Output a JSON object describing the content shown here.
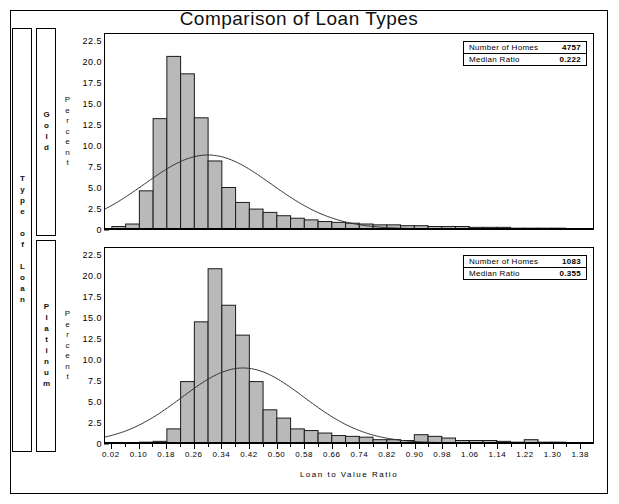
{
  "title": "Comparison of Loan Types",
  "axis": {
    "y_label": "Percent",
    "x_label": "Loan to Value Ratio",
    "y_ticks": [
      "22.5",
      "20.0",
      "17.5",
      "15.0",
      "12.5",
      "10.0",
      "7.5",
      "5.0",
      "2.5",
      "0"
    ],
    "x_ticks": [
      "0.02",
      "0.10",
      "0.18",
      "0.26",
      "0.34",
      "0.42",
      "0.50",
      "0.58",
      "0.66",
      "0.74",
      "0.82",
      "0.90",
      "0.98",
      "1.06",
      "1.14",
      "1.22",
      "1.30",
      "1.38"
    ]
  },
  "classification": {
    "outer_label": "Type of Loan",
    "panel_labels": [
      "Gold",
      "Platinum"
    ]
  },
  "legends": {
    "gold": {
      "number_of_homes_label": "Number of Homes",
      "number_of_homes_value": "4757",
      "median_ratio_label": "Median Ratio",
      "median_ratio_value": "0.222"
    },
    "platinum": {
      "number_of_homes_label": "Number of Homes",
      "number_of_homes_value": "1083",
      "median_ratio_label": "Median Ratio",
      "median_ratio_value": "0.355"
    }
  },
  "colors": {
    "bar_fill": "#b9b9b9",
    "bar_stroke": "#1a1a1a",
    "curve": "#303030",
    "frame": "#000000",
    "background": "#ffffff"
  },
  "chart_data": {
    "type": "bar",
    "title": "Comparison of Loan Types",
    "xlabel": "Loan to Value Ratio",
    "ylabel": "Percent",
    "xlim": [
      0.0,
      1.42
    ],
    "ylim": [
      0,
      23.5
    ],
    "bin_width": 0.04,
    "grid": false,
    "legend_position": "top-right inset box",
    "overlay": "normal density curve",
    "panels": [
      {
        "name": "Gold",
        "number_of_homes": 4757,
        "median_ratio": 0.222,
        "bin_centers": [
          0.04,
          0.08,
          0.12,
          0.16,
          0.2,
          0.24,
          0.28,
          0.32,
          0.36,
          0.4,
          0.44,
          0.48,
          0.52,
          0.56,
          0.6,
          0.64,
          0.68,
          0.72,
          0.76,
          0.8,
          0.84,
          0.88,
          0.92,
          0.96,
          1.0,
          1.04,
          1.08,
          1.12,
          1.16,
          1.2,
          1.24,
          1.28,
          1.32,
          1.36,
          1.4
        ],
        "values": [
          0.3,
          0.6,
          4.6,
          13.3,
          20.8,
          18.7,
          13.4,
          8.2,
          5.0,
          3.2,
          2.4,
          2.0,
          1.6,
          1.3,
          1.1,
          0.9,
          0.8,
          0.7,
          0.6,
          0.5,
          0.5,
          0.4,
          0.4,
          0.3,
          0.3,
          0.3,
          0.2,
          0.2,
          0.2,
          0.1,
          0.1,
          0.1,
          0.1,
          0.05,
          0.05
        ]
      },
      {
        "name": "Platinum",
        "number_of_homes": 1083,
        "median_ratio": 0.355,
        "bin_centers": [
          0.04,
          0.08,
          0.12,
          0.16,
          0.2,
          0.24,
          0.28,
          0.32,
          0.36,
          0.4,
          0.44,
          0.48,
          0.52,
          0.56,
          0.6,
          0.64,
          0.68,
          0.72,
          0.76,
          0.8,
          0.84,
          0.88,
          0.92,
          0.96,
          1.0,
          1.04,
          1.08,
          1.12,
          1.16,
          1.2,
          1.24,
          1.28,
          1.32,
          1.36,
          1.4
        ],
        "values": [
          0.0,
          0.0,
          0.1,
          0.2,
          1.7,
          7.4,
          14.6,
          21.0,
          16.6,
          13.0,
          7.4,
          4.0,
          3.0,
          1.7,
          1.5,
          1.2,
          0.9,
          0.8,
          0.7,
          0.4,
          0.4,
          0.3,
          1.0,
          0.8,
          0.6,
          0.3,
          0.3,
          0.3,
          0.2,
          0.1,
          0.4,
          0.1,
          0.1,
          0.05,
          0.05
        ]
      }
    ]
  }
}
